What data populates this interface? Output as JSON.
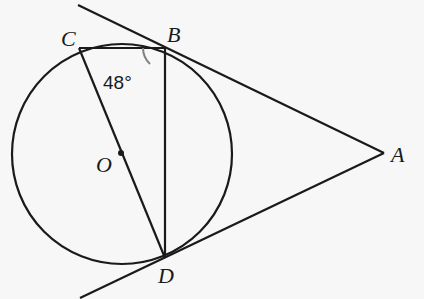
{
  "diagram": {
    "type": "geometry",
    "points": {
      "A": {
        "label": "A",
        "x": 384,
        "y": 153
      },
      "B": {
        "label": "B",
        "x": 165,
        "y": 47
      },
      "C": {
        "label": "C",
        "x": 79,
        "y": 48
      },
      "D": {
        "label": "D",
        "x": 165,
        "y": 258
      },
      "O": {
        "label": "O",
        "x": 121,
        "y": 153
      }
    },
    "circle": {
      "center": "O",
      "cx": 122,
      "cy": 154,
      "r": 110
    },
    "segments": [
      "CB",
      "CO",
      "OD",
      "BD",
      "BA",
      "DA"
    ],
    "tangent_lines": [
      "AB extended",
      "AD extended"
    ],
    "angle": {
      "at": "B",
      "between": [
        "BC",
        "BD"
      ],
      "label": "48°",
      "arc_color": "#808080"
    },
    "colors": {
      "stroke": "#1a1a1a",
      "background": "#f7f7f7",
      "arc": "#808080"
    }
  }
}
